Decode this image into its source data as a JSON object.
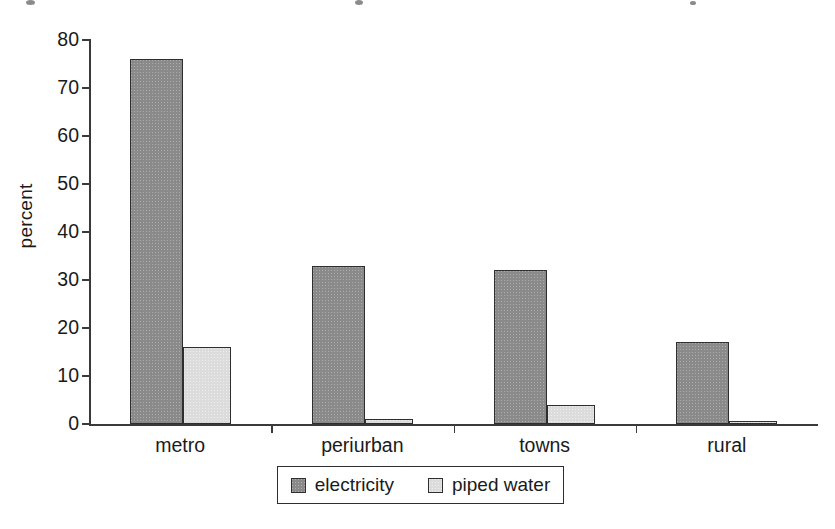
{
  "chart_data": {
    "type": "bar",
    "title": "",
    "xlabel": "",
    "ylabel": "percent",
    "ylim": [
      0,
      80
    ],
    "ytick_step": 10,
    "ytick_labels": [
      "80",
      "70",
      "60",
      "50",
      "40",
      "30",
      "20",
      "10",
      "0"
    ],
    "grid": false,
    "legend_position": "bottom-center",
    "categories": [
      "metro",
      "periurban",
      "towns",
      "rural"
    ],
    "series": [
      {
        "name": "electricity",
        "color": "#8a8a8a",
        "values": [
          76,
          33,
          32,
          17
        ]
      },
      {
        "name": "piped water",
        "color": "#dcdcdc",
        "values": [
          16,
          1,
          4,
          0.3
        ]
      }
    ]
  },
  "legend": {
    "entries": [
      {
        "label": "electricity"
      },
      {
        "label": "piped water"
      }
    ]
  },
  "axes": {
    "y_title": "percent"
  },
  "colors": {
    "series_electricity": "#8a8a8a",
    "series_piped_water": "#dcdcdc",
    "axis": "#3a3a3a",
    "outline": "#2e2e2e",
    "text": "#1a1a1a",
    "background": "#ffffff"
  }
}
